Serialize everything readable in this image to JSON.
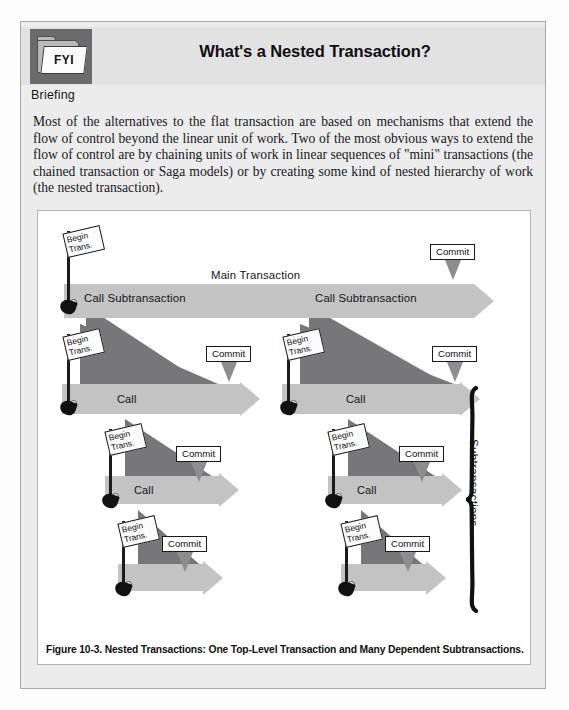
{
  "page": {
    "background_color": "#ececed",
    "figure_background": "#ffffff"
  },
  "header": {
    "icon_label": "FYI",
    "icon_name": "fyi-folder-icon",
    "title": "What's a Nested Transaction?",
    "section_label": "Briefing",
    "band_color": "#e2e2e3"
  },
  "body": {
    "paragraph": "Most of the alternatives to the flat transaction are based on mechanisms that extend the flow of control beyond the linear unit of work.  Two of the most obvious ways to extend the flow of control are by chaining units of work in linear sequences of \"mini\" transactions (the chained transaction or Saga models) or by creating some kind of nested hierarchy of work (the nested transaction)."
  },
  "figure": {
    "caption": "Figure 10-3.  Nested Transactions: One Top-Level Transaction and Many Dependent Subtransactions.",
    "brace_label": "Subtransactions",
    "colors": {
      "arrow": "#c3c3c4",
      "wedge": "#77777a",
      "flag_pole": "#1b1b1d",
      "commit_arrow": "#8d8d90"
    },
    "labels": {
      "main_transaction": "Main Transaction",
      "call_subtransaction": "Call Subtransaction",
      "call": "Call",
      "begin_line1": "Begin",
      "begin_line2": "Trans.",
      "commit": "Commit"
    },
    "levels": [
      {
        "name": "level-0-main",
        "arrow_label": "Main Transaction",
        "sub_labels": [
          "Call Subtransaction",
          "Call Subtransaction"
        ],
        "begin_flags": 1,
        "commits": 1
      },
      {
        "name": "level-1-left",
        "arrow_label": "Call",
        "begin_flags": 1,
        "commits": 1
      },
      {
        "name": "level-1-right",
        "arrow_label": "Call",
        "begin_flags": 1,
        "commits": 1
      },
      {
        "name": "level-2-left",
        "arrow_label": "Call",
        "begin_flags": 1,
        "commits": 1
      },
      {
        "name": "level-2-right",
        "arrow_label": "Call",
        "begin_flags": 1,
        "commits": 1
      },
      {
        "name": "level-3-left",
        "arrow_label": "",
        "begin_flags": 1,
        "commits": 1
      },
      {
        "name": "level-3-right",
        "arrow_label": "",
        "begin_flags": 1,
        "commits": 1
      }
    ]
  }
}
